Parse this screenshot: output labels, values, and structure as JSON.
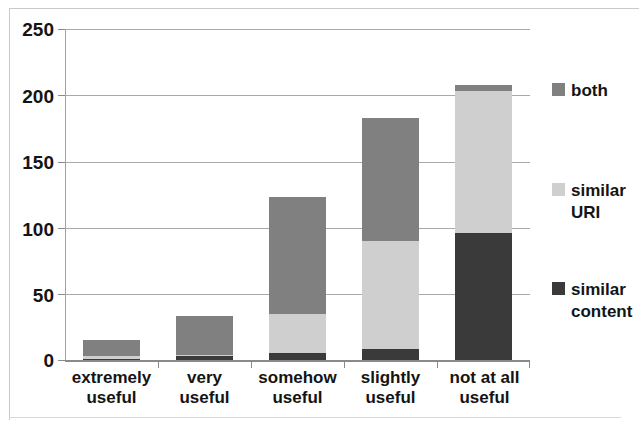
{
  "chart_data": {
    "type": "bar",
    "subtype": "stacked-bar-vertical",
    "title": "",
    "xlabel": "",
    "ylabel": "",
    "ylim": [
      0,
      250
    ],
    "yticks": [
      0,
      50,
      100,
      150,
      200,
      250
    ],
    "grid": true,
    "legend_position": "right",
    "categories": [
      "extremely\nuseful",
      "very\nuseful",
      "somehow\nuseful",
      "slightly\nuseful",
      "not at all\nuseful"
    ],
    "series": [
      {
        "name": "similar\ncontent",
        "legend_label": "similar\ncontent",
        "color": "#3a3a3a",
        "values": [
          1,
          3,
          5,
          8,
          96
        ]
      },
      {
        "name": "similar\nURI",
        "legend_label": "similar\nURI",
        "color": "#cfcfcf",
        "values": [
          2,
          1,
          30,
          82,
          107
        ]
      },
      {
        "name": "both",
        "legend_label": "both",
        "color": "#808080",
        "values": [
          12,
          29,
          88,
          93,
          5
        ]
      }
    ],
    "totals": [
      15,
      33,
      123,
      183,
      208
    ]
  },
  "axis": {
    "y_tick_labels": [
      "250",
      "200",
      "150",
      "100",
      "50",
      "0"
    ]
  },
  "legend": {
    "items": [
      {
        "label": "both",
        "color": "#808080"
      },
      {
        "label": "similar\nURI",
        "color": "#cfcfcf"
      },
      {
        "label": "similar\ncontent",
        "color": "#3a3a3a"
      }
    ]
  },
  "colors": {
    "both": "#808080",
    "similar_uri": "#cfcfcf",
    "similar_content": "#3a3a3a",
    "gridline": "#a9a9a9",
    "axis": "#8a8a8a",
    "text": "#141414",
    "background": "#ffffff"
  }
}
